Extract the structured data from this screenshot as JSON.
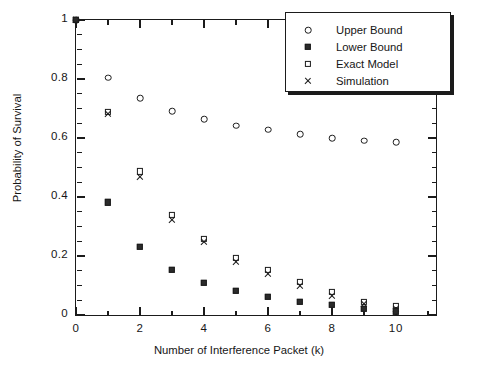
{
  "chart_data": {
    "type": "scatter",
    "title": "",
    "xlabel": "Number of Interference Packet (k)",
    "ylabel": "Probability of Survival",
    "xlim": [
      0,
      11.25
    ],
    "ylim": [
      0,
      1
    ],
    "grid": false,
    "legend_position": "top-right",
    "x_ticks": [
      "0",
      "2",
      "4",
      "6",
      "8",
      "10"
    ],
    "x_tick_values": [
      0,
      2,
      4,
      6,
      8,
      10
    ],
    "x_minor_step": 1,
    "y_ticks": [
      "0",
      "0.2",
      "0.4",
      "0.6",
      "0.8",
      "1"
    ],
    "y_tick_values": [
      0,
      0.2,
      0.4,
      0.6,
      0.8,
      1
    ],
    "y_minor_step": 0.05,
    "x": [
      0,
      1,
      2,
      3,
      4,
      5,
      6,
      7,
      8,
      9,
      10
    ],
    "series": [
      {
        "name": "Upper Bound",
        "marker": "open-circle",
        "values": [
          1.0,
          0.805,
          0.735,
          0.69,
          0.663,
          0.642,
          0.628,
          0.612,
          0.6,
          0.591,
          0.585
        ]
      },
      {
        "name": "Lower Bound",
        "marker": "filled-square",
        "values": [
          1.0,
          0.382,
          0.232,
          0.153,
          0.11,
          0.082,
          0.062,
          0.045,
          0.034,
          0.022,
          0.013
        ]
      },
      {
        "name": "Exact Model",
        "marker": "open-square",
        "values": [
          1.0,
          0.688,
          0.487,
          0.338,
          0.258,
          0.193,
          0.152,
          0.112,
          0.078,
          0.044,
          0.03
        ]
      },
      {
        "name": "Simulation",
        "marker": "cross",
        "values": [
          1.0,
          0.682,
          0.468,
          0.322,
          0.247,
          0.178,
          0.138,
          0.1,
          0.064,
          0.036,
          0.02
        ]
      }
    ]
  },
  "legend": {
    "entries": [
      {
        "label": "Upper Bound",
        "marker": "open-circle"
      },
      {
        "label": "Lower Bound",
        "marker": "filled-square"
      },
      {
        "label": "Exact Model",
        "marker": "open-square"
      },
      {
        "label": "Simulation",
        "marker": "cross"
      }
    ]
  },
  "colors": {
    "foreground": "#1b1b1b",
    "text": "#161616",
    "background": "#ffffff"
  }
}
